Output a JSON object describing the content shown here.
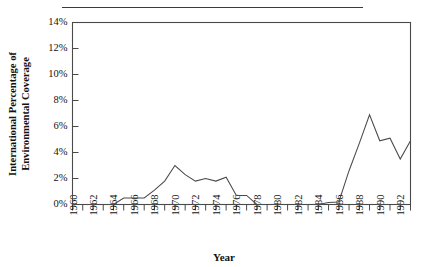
{
  "figure": {
    "separator_rule": true
  },
  "chart_data": {
    "type": "line",
    "title": "",
    "xlabel": "Year",
    "ylabel": "International Percentage of Environmental Coverage",
    "ylabel_lines": [
      "International Percentage of",
      "Environmental Coverage"
    ],
    "grid": false,
    "legend": "none",
    "xlim": [
      1960,
      1993
    ],
    "ylim": [
      0,
      14
    ],
    "ytick_values": [
      0,
      2,
      4,
      6,
      8,
      10,
      12,
      14
    ],
    "ytick_labels": [
      "0%",
      "2%",
      "4%",
      "6%",
      "8%",
      "10%",
      "12%",
      "14%"
    ],
    "xtick_values": [
      1960,
      1961,
      1962,
      1963,
      1964,
      1965,
      1966,
      1967,
      1968,
      1969,
      1970,
      1971,
      1972,
      1973,
      1974,
      1975,
      1976,
      1977,
      1978,
      1979,
      1980,
      1981,
      1982,
      1983,
      1984,
      1985,
      1986,
      1987,
      1988,
      1989,
      1990,
      1991,
      1992,
      1993
    ],
    "xtick_labels": [
      "1960",
      "1962",
      "1964",
      "1966",
      "1968",
      "1970",
      "1972",
      "1974",
      "1976",
      "1978",
      "1980",
      "1982",
      "1984",
      "1986",
      "1988",
      "1990",
      "1992"
    ],
    "xtick_labeled_values": [
      1960,
      1962,
      1964,
      1966,
      1968,
      1970,
      1972,
      1974,
      1976,
      1978,
      1980,
      1982,
      1984,
      1986,
      1988,
      1990,
      1992
    ],
    "series": [
      {
        "name": "International Percentage of Environmental Coverage",
        "color": "#4a4a4a",
        "x": [
          1960,
          1961,
          1962,
          1963,
          1964,
          1965,
          1966,
          1967,
          1968,
          1969,
          1970,
          1971,
          1972,
          1973,
          1974,
          1975,
          1976,
          1977,
          1978,
          1979,
          1980,
          1981,
          1982,
          1983,
          1984,
          1985,
          1986,
          1987,
          1988,
          1989,
          1990,
          1991,
          1992,
          1993
        ],
        "values": [
          0,
          0,
          0,
          0,
          0,
          0.5,
          0.5,
          0.5,
          1.1,
          1.8,
          3.0,
          2.3,
          1.8,
          2.0,
          1.8,
          2.1,
          0.7,
          0.7,
          0,
          0,
          0,
          0,
          0,
          0,
          0,
          0.15,
          0.2,
          2.6,
          4.7,
          6.9,
          4.9,
          5.1,
          3.5,
          4.9
        ]
      }
    ]
  }
}
